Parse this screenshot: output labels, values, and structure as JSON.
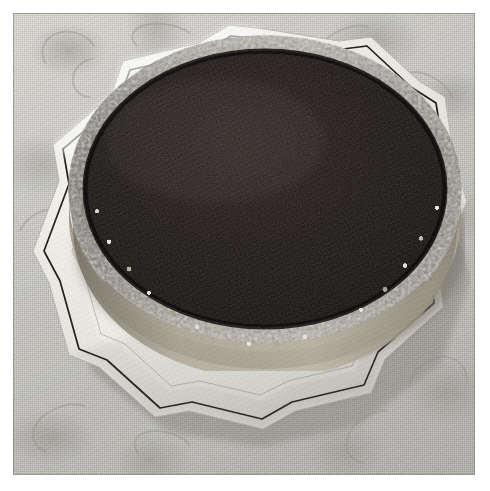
{
  "image": {
    "kind": "photograph",
    "subject": "chocolate-cake-on-plate",
    "caption": "Round chocolate cake with dark cocoa-dusted top and chopped-nut crusted side, resting on a white scalloped porcelain cake plate with a thin dark rim line, set on a damask-patterned tablecloth.",
    "orientation": "square",
    "border_label": "white photo margin"
  },
  "scene": {
    "background": {
      "name": "tablecloth",
      "material": "damask woven linen",
      "pattern": "floral scroll damask",
      "base_color": "#c5c3bd",
      "highlight_color": "#dedcd6",
      "shadow_color": "#aeaca6"
    },
    "plate": {
      "name": "cake-plate",
      "shape": "scalloped octagonal",
      "body_color": "#f4f2ec",
      "shadow_color": "#cdcbc4",
      "rim_line_color": "#22201c",
      "rim_line_label": "thin dark rim trim"
    },
    "cake": {
      "name": "chocolate-cake",
      "shape": "round layer cake",
      "top": {
        "label": "cocoa glazed top",
        "color": "#120e0c",
        "texture": "fine crumb stipple"
      },
      "side": {
        "label": "chopped nut crust",
        "base_color": "#8e8879",
        "light_color": "#f1ede4",
        "dark_color": "#4d4940",
        "texture": "granular chopped nuts"
      }
    }
  },
  "colors": {
    "cake_dark": "#120e0c",
    "nut_light": "#f1ede4",
    "nut_mid": "#a39d8e",
    "nut_dark": "#4d4940",
    "plate_white": "#f4f2ec",
    "plate_shade": "#cdcbc4",
    "trim_dark": "#22201c",
    "cloth_base": "#c5c3bd",
    "margin_white": "#ffffff"
  },
  "geometry": {
    "photo": {
      "x": 13,
      "y": 13,
      "width": 462,
      "height": 462
    },
    "cake_ellipse": {
      "cx": 258,
      "cy": 190,
      "rx": 197,
      "ry": 155
    },
    "plate_center": {
      "cx": 240,
      "cy": 235
    }
  }
}
